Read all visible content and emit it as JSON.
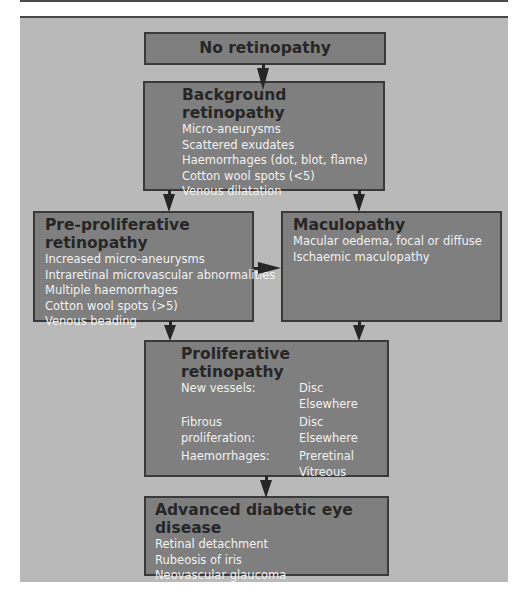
{
  "diagram": {
    "type": "flowchart",
    "colors": {
      "panel_background": "#b9b9b9",
      "box_fill": "#7f7f7f",
      "box_border": "#3a3a3a",
      "title_text": "#262626",
      "body_text": "#f2f2f2",
      "arrow": "#262626"
    },
    "nodes": {
      "no_retinopathy": {
        "title": "No retinopathy"
      },
      "background": {
        "title": "Background retinopathy",
        "items": [
          "Micro-aneurysms",
          "Scattered exudates",
          "Haemorrhages (dot, blot, flame)",
          "Cotton wool spots (<5)",
          "Venous dilatation"
        ]
      },
      "pre_proliferative": {
        "title": "Pre-proliferative retinopathy",
        "items": [
          "Increased micro-aneurysms",
          "Intraretinal microvascular abnormalities",
          "Multiple haemorrhages",
          "Cotton wool spots (>5)",
          "Venous beading"
        ]
      },
      "maculopathy": {
        "title": "Maculopathy",
        "items": [
          "Macular oedema, focal or diffuse",
          "Ischaemic maculopathy"
        ]
      },
      "proliferative": {
        "title": "Proliferative retinopathy",
        "rows": [
          {
            "label": "New vessels:",
            "values": [
              "Disc",
              "Elsewhere"
            ]
          },
          {
            "label": "Fibrous proliferation:",
            "values": [
              "Disc",
              "Elsewhere"
            ]
          },
          {
            "label": "Haemorrhages:",
            "values": [
              "Preretinal",
              "Vitreous"
            ]
          }
        ]
      },
      "advanced": {
        "title": "Advanced diabetic eye disease",
        "items": [
          "Retinal detachment",
          "Rubeosis of iris",
          "Neovascular glaucoma"
        ]
      }
    },
    "edges": [
      {
        "from": "No retinopathy",
        "to": "Background retinopathy"
      },
      {
        "from": "Background retinopathy",
        "to": "Pre-proliferative retinopathy"
      },
      {
        "from": "Background retinopathy",
        "to": "Maculopathy"
      },
      {
        "from": "Pre-proliferative retinopathy",
        "to": "Maculopathy"
      },
      {
        "from": "Pre-proliferative retinopathy",
        "to": "Proliferative retinopathy"
      },
      {
        "from": "Maculopathy",
        "to": "Proliferative retinopathy"
      },
      {
        "from": "Proliferative retinopathy",
        "to": "Advanced diabetic eye disease"
      }
    ]
  }
}
